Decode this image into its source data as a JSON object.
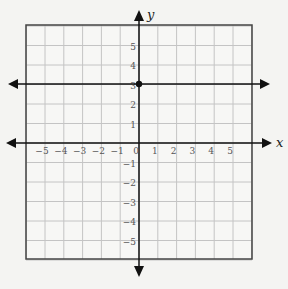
{
  "graph": {
    "axis_labels": {
      "x": "x",
      "y": "y"
    },
    "x_tick_labels": [
      "−5",
      "−4",
      "−3",
      "−2",
      "−1",
      "0",
      "1",
      "2",
      "3",
      "4",
      "5"
    ],
    "y_tick_labels_pos": [
      "5",
      "4",
      "3",
      "2",
      "1"
    ],
    "y_tick_labels_neg": [
      "−1",
      "−2",
      "−3",
      "−4",
      "−5"
    ],
    "grid_range": {
      "xmin": -6,
      "xmax": 6,
      "ymin": -6,
      "ymax": 6
    }
  },
  "chart_data": {
    "type": "line",
    "title": "",
    "xlabel": "x",
    "ylabel": "y",
    "xlim": [
      -6,
      6
    ],
    "ylim": [
      -6,
      6
    ],
    "grid": true,
    "series": [
      {
        "name": "horizontal line",
        "equation": "y = 3.3",
        "x": [
          -6,
          6
        ],
        "y": [
          3.3,
          3.3
        ],
        "arrows": "both"
      }
    ],
    "points": [
      {
        "x": 0,
        "y": 3.3,
        "label": "y-intercept"
      }
    ],
    "x_ticks": [
      -5,
      -4,
      -3,
      -2,
      -1,
      0,
      1,
      2,
      3,
      4,
      5
    ],
    "y_ticks": [
      -5,
      -4,
      -3,
      -2,
      -1,
      1,
      2,
      3,
      4,
      5
    ]
  }
}
